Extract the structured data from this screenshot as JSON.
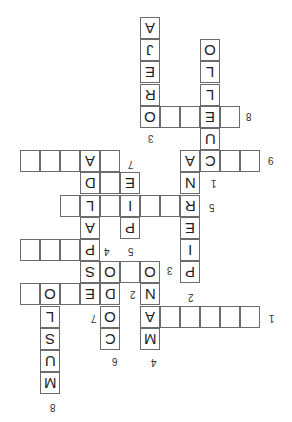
{
  "puzzle": {
    "orientation_deg": 180,
    "grid": {
      "origin_x": 20,
      "origin_y": 17,
      "cell_w": 20,
      "cell_h": 22.2
    },
    "cells": [
      {
        "c": 6,
        "r": 0,
        "ch": "A"
      },
      {
        "c": 6,
        "r": 1,
        "ch": "J"
      },
      {
        "c": 6,
        "r": 2,
        "ch": "E"
      },
      {
        "c": 6,
        "r": 3,
        "ch": "R"
      },
      {
        "c": 6,
        "r": 4,
        "ch": "O"
      },
      {
        "c": 7,
        "r": 4,
        "ch": ""
      },
      {
        "c": 8,
        "r": 4,
        "ch": ""
      },
      {
        "c": 9,
        "r": 4,
        "ch": "E"
      },
      {
        "c": 10,
        "r": 4,
        "ch": ""
      },
      {
        "c": 9,
        "r": 1,
        "ch": "O"
      },
      {
        "c": 9,
        "r": 2,
        "ch": "L"
      },
      {
        "c": 9,
        "r": 3,
        "ch": "L"
      },
      {
        "c": 9,
        "r": 5,
        "ch": "U"
      },
      {
        "c": 9,
        "r": 6,
        "ch": "C"
      },
      {
        "c": 8,
        "r": 6,
        "ch": "A"
      },
      {
        "c": 10,
        "r": 6,
        "ch": ""
      },
      {
        "c": 11,
        "r": 6,
        "ch": ""
      },
      {
        "c": 0,
        "r": 6,
        "ch": ""
      },
      {
        "c": 1,
        "r": 6,
        "ch": ""
      },
      {
        "c": 2,
        "r": 6,
        "ch": ""
      },
      {
        "c": 3,
        "r": 6,
        "ch": "A"
      },
      {
        "c": 4,
        "r": 6,
        "ch": ""
      },
      {
        "c": 3,
        "r": 7,
        "ch": "D"
      },
      {
        "c": 4,
        "r": 7,
        "ch": ""
      },
      {
        "c": 5,
        "r": 7,
        "ch": "E"
      },
      {
        "c": 8,
        "r": 7,
        "ch": "N"
      },
      {
        "c": 2,
        "r": 8,
        "ch": ""
      },
      {
        "c": 3,
        "r": 8,
        "ch": "L"
      },
      {
        "c": 4,
        "r": 8,
        "ch": ""
      },
      {
        "c": 5,
        "r": 8,
        "ch": "I"
      },
      {
        "c": 6,
        "r": 8,
        "ch": ""
      },
      {
        "c": 7,
        "r": 8,
        "ch": ""
      },
      {
        "c": 8,
        "r": 8,
        "ch": "R"
      },
      {
        "c": 3,
        "r": 9,
        "ch": "A"
      },
      {
        "c": 5,
        "r": 9,
        "ch": "P"
      },
      {
        "c": 8,
        "r": 9,
        "ch": "E"
      },
      {
        "c": 0,
        "r": 10,
        "ch": ""
      },
      {
        "c": 1,
        "r": 10,
        "ch": ""
      },
      {
        "c": 2,
        "r": 10,
        "ch": ""
      },
      {
        "c": 3,
        "r": 10,
        "ch": "P"
      },
      {
        "c": 8,
        "r": 10,
        "ch": "I"
      },
      {
        "c": 3,
        "r": 11,
        "ch": "S"
      },
      {
        "c": 4,
        "r": 11,
        "ch": "O"
      },
      {
        "c": 5,
        "r": 11,
        "ch": ""
      },
      {
        "c": 6,
        "r": 11,
        "ch": "O"
      },
      {
        "c": 8,
        "r": 11,
        "ch": "P"
      },
      {
        "c": 0,
        "r": 12,
        "ch": ""
      },
      {
        "c": 1,
        "r": 12,
        "ch": "O"
      },
      {
        "c": 2,
        "r": 12,
        "ch": ""
      },
      {
        "c": 3,
        "r": 12,
        "ch": "E"
      },
      {
        "c": 4,
        "r": 12,
        "ch": "D"
      },
      {
        "c": 6,
        "r": 12,
        "ch": "N"
      },
      {
        "c": 1,
        "r": 13,
        "ch": "L"
      },
      {
        "c": 4,
        "r": 13,
        "ch": "O"
      },
      {
        "c": 6,
        "r": 13,
        "ch": "A"
      },
      {
        "c": 7,
        "r": 13,
        "ch": ""
      },
      {
        "c": 8,
        "r": 13,
        "ch": ""
      },
      {
        "c": 9,
        "r": 13,
        "ch": ""
      },
      {
        "c": 10,
        "r": 13,
        "ch": ""
      },
      {
        "c": 11,
        "r": 13,
        "ch": ""
      },
      {
        "c": 1,
        "r": 14,
        "ch": "S"
      },
      {
        "c": 4,
        "r": 14,
        "ch": "C"
      },
      {
        "c": 6,
        "r": 14,
        "ch": "M"
      },
      {
        "c": 1,
        "r": 15,
        "ch": "U"
      },
      {
        "c": 1,
        "r": 16,
        "ch": "M"
      }
    ],
    "clue_numbers": [
      {
        "label": "3",
        "x": 148,
        "y": 133
      },
      {
        "label": "8",
        "x": 246,
        "y": 111
      },
      {
        "label": "9",
        "x": 268,
        "y": 155
      },
      {
        "label": "1",
        "x": 211,
        "y": 178
      },
      {
        "label": "5",
        "x": 209,
        "y": 202
      },
      {
        "label": "7",
        "x": 128,
        "y": 159
      },
      {
        "label": "4",
        "x": 104,
        "y": 246
      },
      {
        "label": "5",
        "x": 128,
        "y": 246
      },
      {
        "label": "3",
        "x": 167,
        "y": 265
      },
      {
        "label": "2",
        "x": 130,
        "y": 289
      },
      {
        "label": "2",
        "x": 188,
        "y": 292
      },
      {
        "label": "7",
        "x": 91,
        "y": 313
      },
      {
        "label": "1",
        "x": 269,
        "y": 313
      },
      {
        "label": "6",
        "x": 112,
        "y": 356
      },
      {
        "label": "4",
        "x": 151,
        "y": 357
      },
      {
        "label": "8",
        "x": 50,
        "y": 402
      }
    ]
  }
}
